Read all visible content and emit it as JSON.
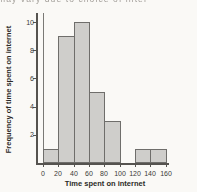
{
  "page": {
    "top_cropped_text": "may vary due to choice of inter",
    "background": "#faf9f6"
  },
  "chart_data": {
    "type": "bar",
    "subtype": "histogram",
    "title": "",
    "xlabel": "Time spent on internet",
    "ylabel": "Frequency of time spent on internet",
    "bin_edges": [
      0,
      20,
      40,
      60,
      80,
      100,
      120,
      140,
      160
    ],
    "categories": [
      "0-20",
      "20-40",
      "40-60",
      "60-80",
      "80-100",
      "100-120",
      "120-140",
      "140-160"
    ],
    "values": [
      1,
      9,
      10,
      5,
      3,
      0,
      1,
      1
    ],
    "x_ticks": [
      0,
      20,
      40,
      60,
      80,
      100,
      120,
      140,
      160
    ],
    "y_ticks": [
      2,
      4,
      6,
      8,
      10
    ],
    "xlim": [
      0,
      160
    ],
    "ylim": [
      0,
      10.6
    ],
    "grid": false,
    "legend": false,
    "bar_fill": "#cfcecb",
    "bar_border": "#6f6e6b",
    "axis_color": "#55534f"
  }
}
